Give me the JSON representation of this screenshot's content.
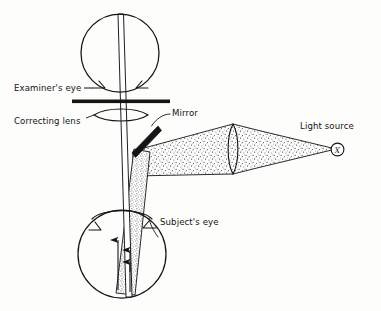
{
  "figure": {
    "background_color": "#fdfdfc",
    "ink_color": "#141414",
    "stipple_color": "#4a4a4a"
  },
  "labels": {
    "examiner_eye": "Examiner's eye",
    "correcting_lens": "Correcting lens",
    "mirror": "Mirror",
    "light_source": "Light source",
    "subject_eye": "Subject's eye",
    "light_source_symbol": "X"
  },
  "components": [
    {
      "name": "examiner-eye-globe",
      "type": "circle",
      "label": "Examiner's eye"
    },
    {
      "name": "correcting-lens",
      "type": "lens",
      "label": "Correcting lens"
    },
    {
      "name": "mirror-bar",
      "type": "bar",
      "label": "Mirror"
    },
    {
      "name": "condensing-lens",
      "type": "lens",
      "label": ""
    },
    {
      "name": "light-source-marker",
      "type": "circle-x",
      "label": "Light source"
    },
    {
      "name": "subject-eye-globe",
      "type": "circle",
      "label": "Subject's eye"
    },
    {
      "name": "illumination-beam",
      "type": "stippled-cone",
      "label": ""
    },
    {
      "name": "reflected-beam",
      "type": "stippled-cone",
      "label": ""
    },
    {
      "name": "observation-ray",
      "type": "ray",
      "label": ""
    }
  ]
}
